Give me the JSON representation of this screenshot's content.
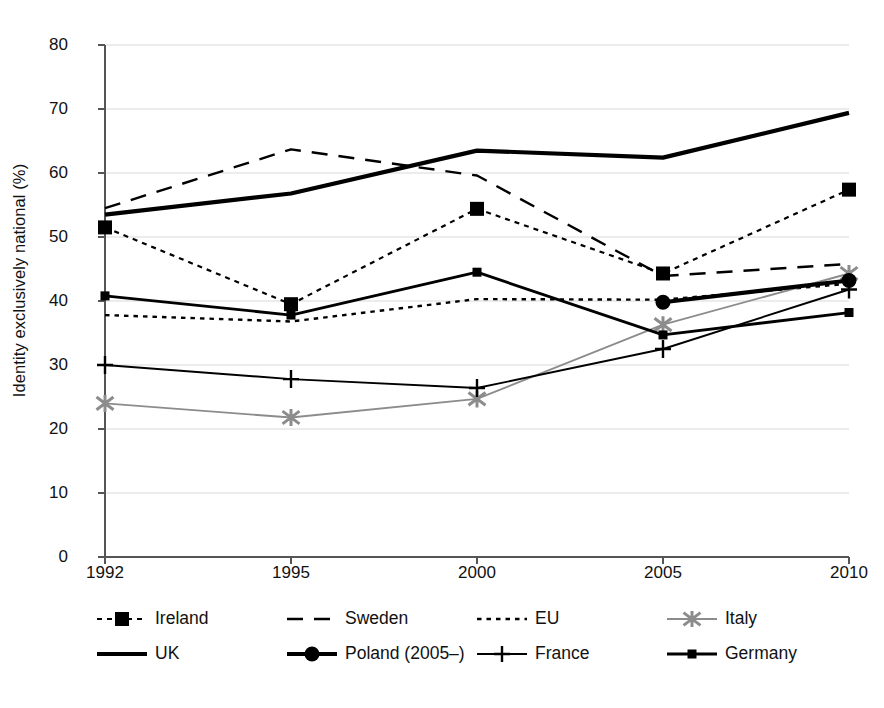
{
  "chart_data": {
    "type": "line",
    "title": "",
    "xlabel": "",
    "ylabel": "Identity exclusively national (%)",
    "categories": [
      "1992",
      "1995",
      "2000",
      "2005",
      "2010"
    ],
    "x": [
      1992,
      1995,
      2000,
      2005,
      2010
    ],
    "ylim": [
      0,
      80
    ],
    "yticks": [
      0,
      10,
      20,
      30,
      40,
      50,
      60,
      70,
      80
    ],
    "grid": true,
    "legend_position": "bottom",
    "series": [
      {
        "name": "Ireland",
        "style": "dotted",
        "marker": "square",
        "color": "#000000",
        "values": [
          51.5,
          39.5,
          54.4,
          44.3,
          57.4
        ]
      },
      {
        "name": "Sweden",
        "style": "dashed",
        "marker": "none",
        "color": "#000000",
        "values": [
          54.5,
          63.7,
          59.6,
          43.9,
          45.8
        ]
      },
      {
        "name": "EU",
        "style": "fine-dotted",
        "marker": "none",
        "color": "#000000",
        "values": [
          37.8,
          36.8,
          40.3,
          40.2,
          42.7
        ]
      },
      {
        "name": "Italy",
        "style": "solid-grey",
        "marker": "asterisk",
        "color": "#8c8c8c",
        "values": [
          24.0,
          21.8,
          24.7,
          36.3,
          44.3
        ]
      },
      {
        "name": "UK",
        "style": "solid-thick",
        "marker": "none",
        "color": "#000000",
        "values": [
          53.5,
          56.8,
          63.5,
          62.4,
          69.4
        ]
      },
      {
        "name": "Poland (2005–)",
        "style": "solid-thick",
        "marker": "circle",
        "color": "#000000",
        "values": [
          null,
          null,
          null,
          39.8,
          43.2
        ]
      },
      {
        "name": "France",
        "style": "solid-thin",
        "marker": "plus",
        "color": "#000000",
        "values": [
          30.0,
          27.8,
          26.4,
          32.5,
          41.8
        ]
      },
      {
        "name": "Germany",
        "style": "solid-medium",
        "marker": "small-square",
        "color": "#000000",
        "values": [
          40.8,
          37.8,
          44.5,
          34.7,
          38.2
        ]
      }
    ]
  },
  "axis": {
    "y_label": "Identity exclusively national (%)",
    "y_ticks": [
      "80",
      "70",
      "60",
      "50",
      "40",
      "30",
      "20",
      "10",
      "0"
    ],
    "x_ticks": [
      "1992",
      "1995",
      "2000",
      "2005",
      "2010"
    ]
  },
  "legend": {
    "items": [
      {
        "label": "Ireland",
        "key": "dotted-square"
      },
      {
        "label": "Sweden",
        "key": "dashed"
      },
      {
        "label": "EU",
        "key": "fine-dotted"
      },
      {
        "label": "Italy",
        "key": "grey-asterisk"
      },
      {
        "label": "UK",
        "key": "solid-thick"
      },
      {
        "label": "Poland (2005–)",
        "key": "solid-circle"
      },
      {
        "label": "France",
        "key": "solid-plus"
      },
      {
        "label": "Germany",
        "key": "solid-small-square"
      }
    ]
  },
  "colors": {
    "axis": "#555555",
    "grid": "#e6e6e6",
    "ink": "#000000",
    "grey_series": "#8c8c8c"
  }
}
